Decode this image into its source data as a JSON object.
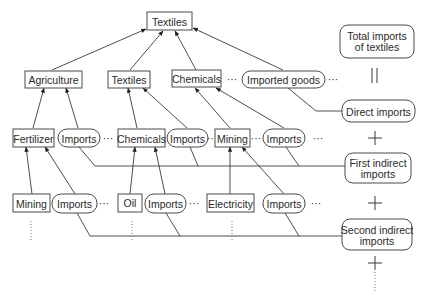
{
  "diagram": {
    "root": {
      "label": "Textiles"
    },
    "level1": {
      "agriculture": "Agriculture",
      "textiles": "Textiles",
      "chemicals": "Chemicals",
      "imported_goods": "Imported goods"
    },
    "level2": {
      "fertilizer": "Fertilizer",
      "imports_a": "Imports",
      "chemicals": "Chemicals",
      "imports_b": "Imports",
      "mining": "Mining",
      "imports_c": "Imports"
    },
    "level3": {
      "mining": "Mining",
      "imports_a": "Imports",
      "oil": "Oil",
      "imports_b": "Imports",
      "electricity": "Electricity",
      "imports_c": "Imports"
    },
    "summary": {
      "total_line1": "Total imports",
      "total_line2": "of textiles",
      "equals": "||",
      "direct": "Direct imports",
      "plus": "+",
      "first_line1": "First indirect",
      "first_line2": "imports",
      "second_line1": "Second indirect",
      "second_line2": "imports"
    },
    "ellipsis": "···"
  }
}
